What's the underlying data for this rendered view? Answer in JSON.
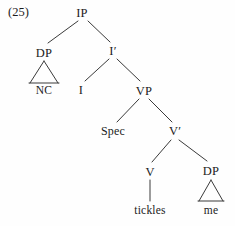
{
  "figure": {
    "example_number": "(25)",
    "type": "syntax-tree",
    "sentence": "tickles me"
  },
  "nodes": {
    "ip": "IP",
    "dp_subject": "DP",
    "nc": "NC",
    "i_bar": "I′",
    "i_head": "I",
    "vp": "VP",
    "spec": "Spec",
    "v_bar": "V′",
    "v_head": "V",
    "tickles": "tickles",
    "dp_object": "DP",
    "me": "me"
  },
  "colors": {
    "line": "#3a3a3a",
    "text": "#1c1c1c",
    "background": "#fefefe"
  }
}
